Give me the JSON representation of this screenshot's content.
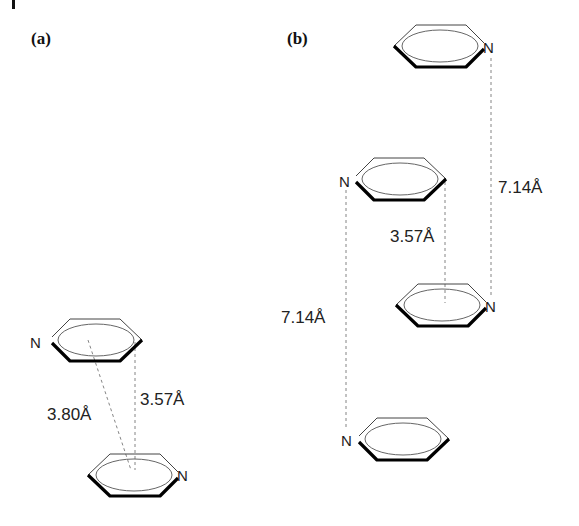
{
  "figure": {
    "corner_mark": "|",
    "panels": [
      {
        "id": "a",
        "label": "(a)",
        "molecules": [
          {
            "name": "pyridine",
            "atom_label": "N",
            "position": "top"
          },
          {
            "name": "pyridine",
            "atom_label": "N",
            "position": "bottom"
          }
        ],
        "distances": [
          {
            "value": "3.80Å",
            "type": "centroid-centroid"
          },
          {
            "value": "3.57Å",
            "type": "interplanar"
          }
        ]
      },
      {
        "id": "b",
        "label": "(b)",
        "molecules": [
          {
            "name": "pyridine",
            "atom_label": "N",
            "position": "top-right"
          },
          {
            "name": "pyridine",
            "atom_label": "N",
            "position": "upper-left"
          },
          {
            "name": "pyridine",
            "atom_label": "N",
            "position": "lower-right"
          },
          {
            "name": "pyridine",
            "atom_label": "N",
            "position": "bottom-left"
          }
        ],
        "distances": [
          {
            "value": "7.14Å",
            "type": "right-stack"
          },
          {
            "value": "3.57Å",
            "type": "inter-column"
          },
          {
            "value": "7.14Å",
            "type": "left-stack"
          }
        ]
      }
    ]
  }
}
